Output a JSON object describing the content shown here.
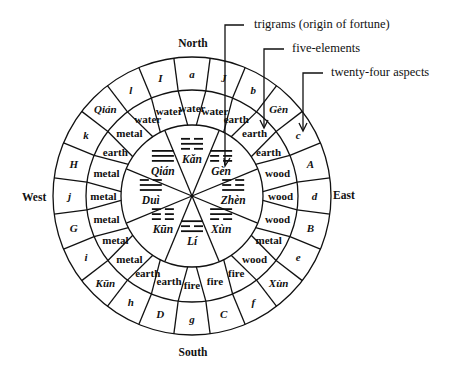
{
  "diagram": {
    "directions": {
      "north": "North",
      "south": "South",
      "east": "East",
      "west": "West"
    },
    "annotations": [
      {
        "label": "trigrams (origin of fortune)"
      },
      {
        "label": "five-elements"
      },
      {
        "label": "twenty-four aspects"
      }
    ],
    "trigrams": [
      {
        "name": "Kǎn",
        "lines": [
          0,
          1,
          0
        ]
      },
      {
        "name": "Gèn",
        "lines": [
          1,
          0,
          0
        ]
      },
      {
        "name": "Zhèn",
        "lines": [
          0,
          0,
          1
        ]
      },
      {
        "name": "Xùn",
        "lines": [
          1,
          1,
          0
        ]
      },
      {
        "name": "Lí",
        "lines": [
          1,
          0,
          1
        ]
      },
      {
        "name": "Kūn",
        "lines": [
          0,
          0,
          0
        ]
      },
      {
        "name": "Duì",
        "lines": [
          0,
          1,
          1
        ]
      },
      {
        "name": "Qián",
        "lines": [
          1,
          1,
          1
        ]
      }
    ],
    "five_elements": [
      "water",
      "water",
      "earth",
      "earth",
      "earth",
      "wood",
      "wood",
      "wood",
      "metal",
      "wood",
      "fire",
      "fire",
      "fire",
      "earth",
      "earth",
      "metal",
      "metal",
      "metal",
      "metal",
      "metal",
      "earth",
      "metal",
      "water",
      "water"
    ],
    "twenty_four_aspects": [
      "a",
      "J",
      "b",
      "Gèn",
      "c",
      "A",
      "d",
      "B",
      "e",
      "Xùn",
      "f",
      "C",
      "g",
      "D",
      "h",
      "Kūn",
      "i",
      "G",
      "j",
      "H",
      "k",
      "Qián",
      "l",
      "I"
    ]
  }
}
